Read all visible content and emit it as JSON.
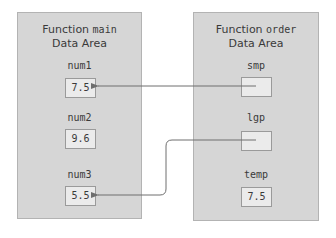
{
  "main_area": {
    "title_prefix": "Function ",
    "title_code": "main",
    "subtitle": "Data Area",
    "vars": [
      {
        "name": "num1",
        "value": "7.5"
      },
      {
        "name": "num2",
        "value": "9.6"
      },
      {
        "name": "num3",
        "value": "5.5"
      }
    ]
  },
  "order_area": {
    "title_prefix": "Function ",
    "title_code": "order",
    "subtitle": "Data Area",
    "vars": [
      {
        "name": "smp",
        "value": ""
      },
      {
        "name": "lgp",
        "value": ""
      },
      {
        "name": "temp",
        "value": "7.5"
      }
    ]
  },
  "colors": {
    "panel_bg": "#d6d6d6",
    "box_bg": "#ebebeb",
    "arrow": "#6e6e6e"
  }
}
